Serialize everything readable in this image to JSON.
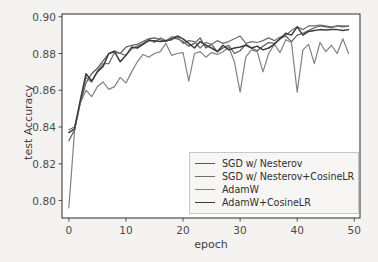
{
  "chart_data": {
    "type": "line",
    "title": "",
    "xlabel": "epoch",
    "ylabel": "test Accuracy",
    "xlim": [
      -1.2,
      51
    ],
    "ylim": [
      0.7905,
      0.9015
    ],
    "xticks": [
      0,
      10,
      20,
      30,
      40,
      50
    ],
    "xtick_labels": [
      "0",
      "10",
      "20",
      "30",
      "40",
      "50"
    ],
    "yticks": [
      0.8,
      0.82,
      0.84,
      0.86,
      0.88,
      0.9
    ],
    "ytick_labels": [
      "0.80",
      "0.82",
      "0.84",
      "0.86",
      "0.88",
      "0.90"
    ],
    "grid": false,
    "legend_position": "lower right",
    "x": [
      0,
      1,
      2,
      3,
      4,
      5,
      6,
      7,
      8,
      9,
      10,
      11,
      12,
      13,
      14,
      15,
      16,
      17,
      18,
      19,
      20,
      21,
      22,
      23,
      24,
      25,
      26,
      27,
      28,
      29,
      30,
      31,
      32,
      33,
      34,
      35,
      36,
      37,
      38,
      39,
      40,
      41,
      42,
      43,
      44,
      45,
      46,
      47,
      48,
      49
    ],
    "series": [
      {
        "name": "SGD w/ Nesterov",
        "color": "#595959",
        "linewidth": 1.2,
        "values": [
          0.8325,
          0.8385,
          0.853,
          0.864,
          0.869,
          0.872,
          0.876,
          0.88,
          0.8815,
          0.88,
          0.8835,
          0.8845,
          0.885,
          0.8865,
          0.888,
          0.8885,
          0.8875,
          0.8865,
          0.8885,
          0.888,
          0.8865,
          0.884,
          0.8855,
          0.8885,
          0.883,
          0.885,
          0.881,
          0.883,
          0.8845,
          0.88,
          0.8815,
          0.885,
          0.883,
          0.8815,
          0.884,
          0.886,
          0.8855,
          0.888,
          0.8895,
          0.8865,
          0.89,
          0.891,
          0.8925,
          0.894,
          0.895,
          0.8945,
          0.894,
          0.895,
          0.8945,
          0.895
        ]
      },
      {
        "name": "SGD w/ Nesterov+CosineLR",
        "color": "#6e6e6e",
        "linewidth": 1.2,
        "values": [
          0.8385,
          0.84,
          0.8535,
          0.867,
          0.8645,
          0.8705,
          0.8745,
          0.8745,
          0.8805,
          0.88,
          0.879,
          0.8825,
          0.884,
          0.8855,
          0.888,
          0.886,
          0.8885,
          0.887,
          0.889,
          0.889,
          0.8855,
          0.887,
          0.8865,
          0.883,
          0.886,
          0.885,
          0.887,
          0.8855,
          0.8865,
          0.888,
          0.8895,
          0.8855,
          0.8865,
          0.886,
          0.887,
          0.8885,
          0.887,
          0.889,
          0.89,
          0.8925,
          0.8945,
          0.893,
          0.895,
          0.895,
          0.8955,
          0.895,
          0.8945,
          0.895,
          0.895,
          0.8948
        ]
      },
      {
        "name": "AdamW",
        "color": "#818181",
        "linewidth": 1.2,
        "values": [
          0.796,
          0.838,
          0.853,
          0.86,
          0.8565,
          0.862,
          0.8645,
          0.8605,
          0.862,
          0.867,
          0.864,
          0.87,
          0.8755,
          0.8795,
          0.878,
          0.88,
          0.881,
          0.8855,
          0.879,
          0.88,
          0.8805,
          0.865,
          0.88,
          0.881,
          0.878,
          0.8805,
          0.8795,
          0.881,
          0.8835,
          0.8755,
          0.859,
          0.878,
          0.882,
          0.881,
          0.87,
          0.88,
          0.885,
          0.8805,
          0.8875,
          0.886,
          0.859,
          0.882,
          0.885,
          0.8745,
          0.886,
          0.881,
          0.8845,
          0.88,
          0.888,
          0.88
        ]
      },
      {
        "name": "AdamW+CosineLR",
        "color": "#3c3c3c",
        "linewidth": 1.5,
        "values": [
          0.837,
          0.839,
          0.8545,
          0.869,
          0.865,
          0.87,
          0.873,
          0.88,
          0.881,
          0.8755,
          0.879,
          0.8835,
          0.883,
          0.885,
          0.887,
          0.887,
          0.8865,
          0.887,
          0.8875,
          0.8895,
          0.888,
          0.8855,
          0.883,
          0.8865,
          0.8845,
          0.883,
          0.881,
          0.8845,
          0.882,
          0.883,
          0.8835,
          0.8845,
          0.883,
          0.884,
          0.882,
          0.883,
          0.885,
          0.888,
          0.891,
          0.89,
          0.8945,
          0.89,
          0.892,
          0.8925,
          0.893,
          0.8928,
          0.893,
          0.893,
          0.8925,
          0.893
        ]
      }
    ]
  },
  "legend": {
    "entries": [
      {
        "label": "SGD w/ Nesterov"
      },
      {
        "label": "SGD w/ Nesterov+CosineLR"
      },
      {
        "label": "AdamW"
      },
      {
        "label": "AdamW+CosineLR"
      }
    ]
  },
  "axes": {
    "spine_color": "#3f3f3f",
    "background": "#ffffff",
    "figure_background": "#f4f3f1"
  }
}
